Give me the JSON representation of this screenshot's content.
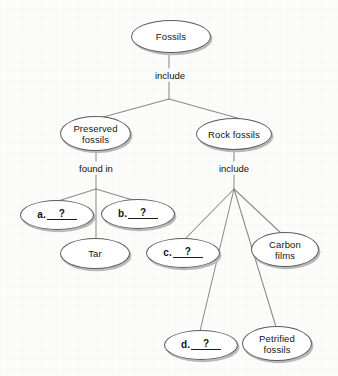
{
  "diagram": {
    "type": "concept-map",
    "nodes": [
      {
        "id": "fossils",
        "label": "Fossils",
        "kind": "term",
        "x": 131,
        "y": 20,
        "w": 80,
        "h": 33
      },
      {
        "id": "preserved-fossils",
        "label": "Preserved\nfossils",
        "kind": "term",
        "x": 60,
        "y": 116,
        "w": 71,
        "h": 35
      },
      {
        "id": "rock-fossils",
        "label": "Rock fossils",
        "kind": "term",
        "x": 196,
        "y": 118,
        "w": 76,
        "h": 32
      },
      {
        "id": "blank-a",
        "label": "a.",
        "answer": "?",
        "kind": "blank",
        "x": 20,
        "y": 200,
        "w": 74,
        "h": 30
      },
      {
        "id": "blank-b",
        "label": "b.",
        "answer": "?",
        "kind": "blank",
        "x": 101,
        "y": 199,
        "w": 74,
        "h": 30
      },
      {
        "id": "tar",
        "label": "Tar",
        "kind": "term",
        "x": 60,
        "y": 238,
        "w": 70,
        "h": 31
      },
      {
        "id": "blank-c",
        "label": "c.",
        "answer": "?",
        "kind": "blank",
        "x": 146,
        "y": 238,
        "w": 74,
        "h": 30
      },
      {
        "id": "carbon-films",
        "label": "Carbon\nfilms",
        "kind": "term",
        "x": 251,
        "y": 232,
        "w": 68,
        "h": 35
      },
      {
        "id": "blank-d",
        "label": "d.",
        "answer": "?",
        "kind": "blank",
        "x": 164,
        "y": 330,
        "w": 74,
        "h": 30
      },
      {
        "id": "petrified-fossils",
        "label": "Petrified\nfossils",
        "kind": "term",
        "x": 242,
        "y": 326,
        "w": 70,
        "h": 35
      }
    ],
    "connector_labels": [
      {
        "id": "include-top",
        "text": "include",
        "x": 145,
        "y": 70,
        "w": 50
      },
      {
        "id": "found-in",
        "text": "found in",
        "x": 68,
        "y": 163,
        "w": 56
      },
      {
        "id": "include-rocks",
        "text": "include",
        "x": 209,
        "y": 163,
        "w": 50
      }
    ],
    "colors": {
      "background": "#fcfcfb",
      "node_fill": "#ffffff",
      "node_stroke": "#5d5d5d",
      "node_shadow": "#b9b9b9",
      "line": "#8a8a8a",
      "text": "#141414"
    }
  }
}
